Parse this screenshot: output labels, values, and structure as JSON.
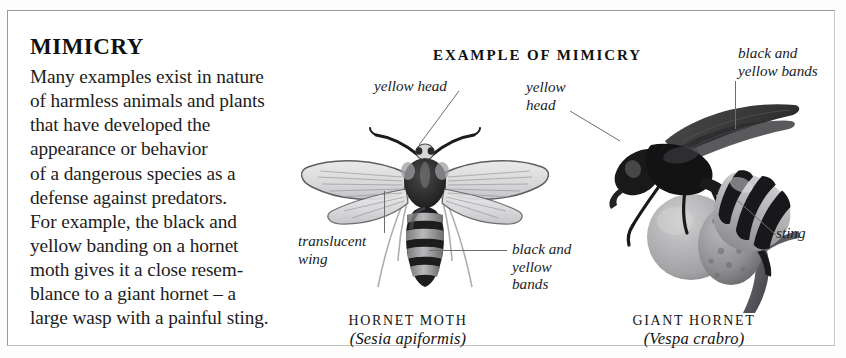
{
  "page": {
    "background_color": "#ffffff",
    "frame_color": "#9a9a9a"
  },
  "article": {
    "heading": "MIMICRY",
    "body": "Many examples exist in nature\nof harmless animals and plants\nthat have developed the\nappearance or behavior\nof a dangerous species as a\ndefense against predators.\nFor example, the black and\nyellow banding on a hornet\nmoth gives it a close resem-\nblance to a giant hornet – a\nlarge wasp with a painful sting."
  },
  "figure": {
    "title": "EXAMPLE OF MIMICRY",
    "labels": {
      "moth_head": "yellow head",
      "moth_wing": "translucent\nwing",
      "moth_bands": "black and\nyellow\nbands",
      "hornet_head": "yellow\nhead",
      "hornet_bands": "black and\nyellow bands",
      "hornet_sting": "sting"
    },
    "captions": [
      {
        "id": "hornet-moth",
        "common_name": "HORNET MOTH",
        "latin_name": "(Sesia apiformis)"
      },
      {
        "id": "giant-hornet",
        "common_name": "GIANT HORNET",
        "latin_name": "(Vespa crabro)"
      }
    ],
    "specimens": [
      {
        "id": "hornet-moth-photo",
        "icon": "hornet-moth-illustration"
      },
      {
        "id": "giant-hornet-photo",
        "icon": "giant-hornet-illustration"
      }
    ]
  }
}
